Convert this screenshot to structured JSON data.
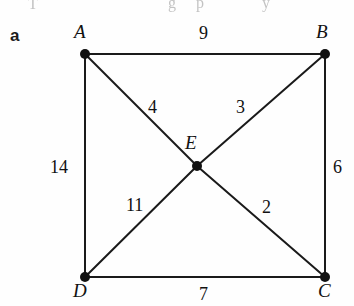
{
  "figure": {
    "panel_label": "a",
    "top_remnant_text": [
      {
        "text": "T",
        "x": 28,
        "y": -5
      },
      {
        "text": "g",
        "x": 168,
        "y": -6
      },
      {
        "text": "p",
        "x": 196,
        "y": -6
      },
      {
        "text": "y",
        "x": 262,
        "y": -6
      }
    ]
  },
  "graph": {
    "stroke_color": "#1a1a1a",
    "node_color": "#111111",
    "background": "#fefefe",
    "nodes": [
      {
        "id": "A",
        "label": "A",
        "x": 85,
        "y": 54,
        "label_x": 74,
        "label_y": 22
      },
      {
        "id": "B",
        "label": "B",
        "x": 325,
        "y": 54,
        "label_x": 316,
        "label_y": 22
      },
      {
        "id": "C",
        "label": "C",
        "x": 325,
        "y": 277,
        "label_x": 318,
        "label_y": 281
      },
      {
        "id": "D",
        "label": "D",
        "x": 85,
        "y": 277,
        "label_x": 73,
        "label_y": 281
      },
      {
        "id": "E",
        "label": "E",
        "x": 197,
        "y": 166,
        "label_x": 185,
        "label_y": 133
      }
    ],
    "edges": [
      {
        "from": "A",
        "to": "B",
        "weight": "9",
        "label_x": 199,
        "label_y": 24
      },
      {
        "from": "A",
        "to": "D",
        "weight": "14",
        "label_x": 50,
        "label_y": 158
      },
      {
        "from": "B",
        "to": "C",
        "weight": "6",
        "label_x": 333,
        "label_y": 158
      },
      {
        "from": "D",
        "to": "C",
        "weight": "7",
        "label_x": 199,
        "label_y": 285
      },
      {
        "from": "A",
        "to": "E",
        "weight": "4",
        "label_x": 148,
        "label_y": 98
      },
      {
        "from": "E",
        "to": "B",
        "weight": "3",
        "label_x": 236,
        "label_y": 98
      },
      {
        "from": "D",
        "to": "E",
        "weight": "11",
        "label_x": 126,
        "label_y": 196
      },
      {
        "from": "E",
        "to": "C",
        "weight": "2",
        "label_x": 262,
        "label_y": 198
      }
    ]
  }
}
